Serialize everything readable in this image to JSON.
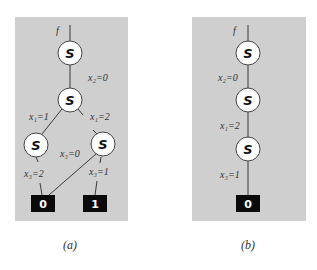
{
  "figure": {
    "panels": [
      {
        "id": "a",
        "caption": "(a)",
        "function_label": "f",
        "nodes": [
          {
            "id": "a-root",
            "label": "S"
          },
          {
            "id": "a-mid",
            "label": "S"
          },
          {
            "id": "a-left",
            "label": "S"
          },
          {
            "id": "a-right",
            "label": "S"
          }
        ],
        "terminals": [
          {
            "id": "a-t0",
            "label": "0"
          },
          {
            "id": "a-t1",
            "label": "1"
          }
        ],
        "edges": [
          {
            "from": "a-root",
            "to": "a-mid",
            "label": "x₂=0"
          },
          {
            "from": "a-mid",
            "to": "a-left",
            "label": "x₁=1"
          },
          {
            "from": "a-mid",
            "to": "a-right",
            "label": "x₁=2"
          },
          {
            "from": "a-left",
            "to": "a-t0",
            "label": "x₃=2"
          },
          {
            "from": "a-right",
            "to": "a-t0",
            "label": "x₃=0"
          },
          {
            "from": "a-right",
            "to": "a-t1",
            "label": "x₃=1"
          }
        ]
      },
      {
        "id": "b",
        "caption": "(b)",
        "function_label": "f",
        "nodes": [
          {
            "id": "b-1",
            "label": "S"
          },
          {
            "id": "b-2",
            "label": "S"
          },
          {
            "id": "b-3",
            "label": "S"
          }
        ],
        "terminals": [
          {
            "id": "b-t0",
            "label": "0"
          }
        ],
        "edges": [
          {
            "from": "b-1",
            "to": "b-2",
            "label": "x₂=0"
          },
          {
            "from": "b-2",
            "to": "b-3",
            "label": "x₁=2"
          },
          {
            "from": "b-3",
            "to": "b-t0",
            "label": "x₃=1"
          }
        ]
      }
    ],
    "colors": {
      "panel_bg": "#cfcfcf",
      "node_fill": "#ffffff",
      "terminal_fill": "#0a0a0a"
    }
  }
}
